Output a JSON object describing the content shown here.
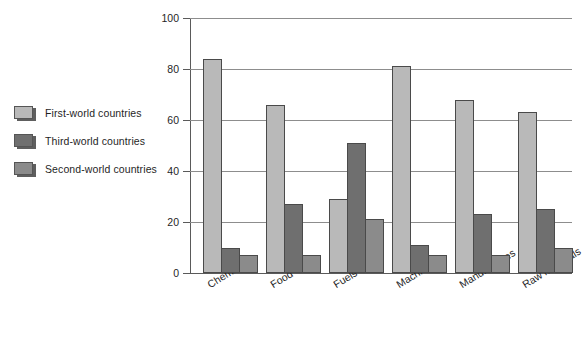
{
  "chart_data": {
    "type": "bar",
    "title": "",
    "xlabel": "",
    "ylabel": "",
    "ylim": [
      0,
      100
    ],
    "yticks": [
      0,
      20,
      40,
      60,
      80,
      100
    ],
    "grid": true,
    "legend_position": "left-outside",
    "categories": [
      "Chemicals",
      "Food",
      "Fuels",
      "Machinery",
      "Manufactures",
      "Raw materials"
    ],
    "series": [
      {
        "name": "First-world countries",
        "color": "#b9b9b9",
        "values": [
          84,
          66,
          29,
          81,
          68,
          63
        ]
      },
      {
        "name": "Third-world countries",
        "color": "#6f6f6f",
        "values": [
          10,
          27,
          51,
          11,
          23,
          25
        ]
      },
      {
        "name": "Second-world countries",
        "color": "#8b8b8b",
        "values": [
          7,
          7,
          21,
          7,
          7,
          10
        ]
      }
    ]
  },
  "colors": {
    "background": "#ffffff",
    "axis": "#5a5a5a",
    "gridline": "#8d8d8d",
    "text": "#1f1f1f",
    "bar_outline": "#4a4a4a"
  }
}
